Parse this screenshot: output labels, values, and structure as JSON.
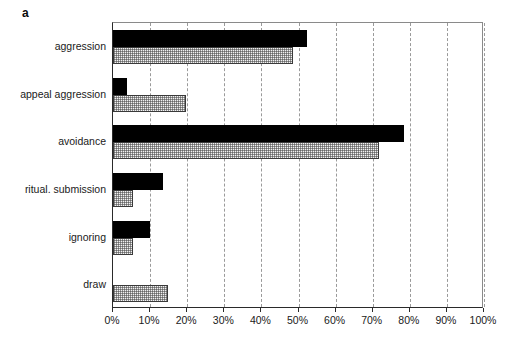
{
  "figure": {
    "panel_label": "a",
    "background_color": "#ffffff"
  },
  "chart_data": {
    "type": "bar",
    "orientation": "horizontal",
    "title": "",
    "xlabel": "",
    "ylabel": "",
    "categories": [
      "aggression",
      "appeal aggression",
      "avoidance",
      "ritual. submission",
      "ignoring",
      "draw"
    ],
    "series": [
      {
        "name": "series-1-black",
        "fill": "solid-black",
        "color": "#000000",
        "values": [
          52.3,
          3.7,
          78.4,
          13.6,
          10.1,
          0
        ]
      },
      {
        "name": "series-2-hatched",
        "fill": "hatched-gray",
        "color": "#d8d8d8",
        "values": [
          48.5,
          19.7,
          71.6,
          5.5,
          5.3,
          14.8
        ]
      }
    ],
    "xlim": [
      0,
      100
    ],
    "xticks": [
      0,
      10,
      20,
      30,
      40,
      50,
      60,
      70,
      80,
      90,
      100
    ],
    "xtick_labels": [
      "0%",
      "10%",
      "20%",
      "30%",
      "40%",
      "50%",
      "60%",
      "70%",
      "80%",
      "90%",
      "100%"
    ],
    "grid": "vertical-dashed",
    "legend": "none",
    "units": "percent"
  }
}
